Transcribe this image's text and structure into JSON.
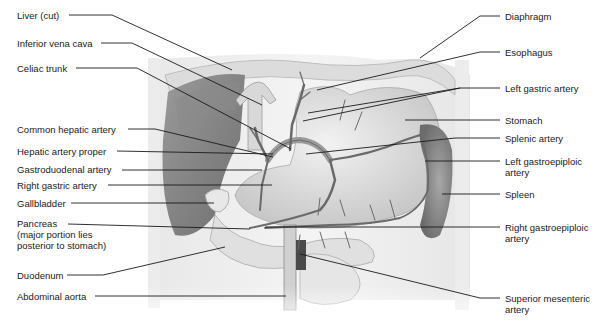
{
  "figure": {
    "type": "anatomical-illustration",
    "left_labels": [
      {
        "id": "liver",
        "text": "Liver (cut)",
        "x": 17,
        "y": 10,
        "line": [
          [
            69,
            15
          ],
          [
            112,
            15
          ],
          [
            232,
            70
          ]
        ]
      },
      {
        "id": "ivc",
        "text": "Inferior vena cava",
        "x": 17,
        "y": 38,
        "line": [
          [
            101,
            43
          ],
          [
            132,
            43
          ],
          [
            262,
            105
          ]
        ]
      },
      {
        "id": "celiac",
        "text": "Celiac trunk",
        "x": 17,
        "y": 63,
        "line": [
          [
            76,
            68
          ],
          [
            137,
            68
          ],
          [
            291,
            149
          ]
        ]
      },
      {
        "id": "common-hepatic",
        "text": "Common hepatic artery",
        "x": 17,
        "y": 124,
        "line": [
          [
            128,
            129
          ],
          [
            155,
            129
          ],
          [
            273,
            157
          ]
        ]
      },
      {
        "id": "hepatic-proper",
        "text": "Hepatic artery proper",
        "x": 17,
        "y": 147,
        "line": [
          [
            117,
            151
          ],
          [
            273,
            154
          ]
        ]
      },
      {
        "id": "gastroduodenal",
        "text": "Gastroduodenal artery",
        "x": 17,
        "y": 165,
        "line": [
          [
            122,
            170
          ],
          [
            262,
            170
          ]
        ]
      },
      {
        "id": "right-gastric",
        "text": "Right gastric artery",
        "x": 17,
        "y": 180,
        "line": [
          [
            108,
            185
          ],
          [
            272,
            185
          ]
        ]
      },
      {
        "id": "gallbladder",
        "text": "Gallbladder",
        "x": 17,
        "y": 199,
        "line": [
          [
            71,
            203
          ],
          [
            214,
            203
          ]
        ]
      },
      {
        "id": "pancreas",
        "text": "Pancreas\n(major portion lies\nposterior to stomach)",
        "x": 17,
        "y": 218,
        "line": [
          [
            68,
            224
          ],
          [
            250,
            229
          ]
        ]
      },
      {
        "id": "duodenum",
        "text": "Duodenum",
        "x": 17,
        "y": 270,
        "line": [
          [
            67,
            275
          ],
          [
            103,
            275
          ],
          [
            225,
            247
          ]
        ]
      },
      {
        "id": "abdominal-aorta",
        "text": "Abdominal aorta",
        "x": 17,
        "y": 291,
        "line": [
          [
            95,
            296
          ],
          [
            286,
            296
          ]
        ]
      }
    ],
    "right_labels": [
      {
        "id": "diaphragm",
        "text": "Diaphragm",
        "x": 505,
        "y": 12,
        "line": [
          [
            500,
            16
          ],
          [
            480,
            16
          ],
          [
            420,
            58
          ]
        ]
      },
      {
        "id": "esophagus",
        "text": "Esophagus",
        "x": 505,
        "y": 47,
        "line": [
          [
            500,
            52
          ],
          [
            480,
            52
          ],
          [
            317,
            90
          ]
        ]
      },
      {
        "id": "left-gastric",
        "text": "Left gastric artery",
        "x": 505,
        "y": 83,
        "line": [
          [
            500,
            88
          ],
          [
            460,
            88
          ],
          [
            308,
            113
          ]
        ],
        "line2": [
          [
            460,
            88
          ],
          [
            303,
            121
          ]
        ]
      },
      {
        "id": "stomach",
        "text": "Stomach",
        "x": 505,
        "y": 115,
        "line": [
          [
            500,
            120
          ],
          [
            405,
            120
          ]
        ]
      },
      {
        "id": "splenic",
        "text": "Splenic artery",
        "x": 505,
        "y": 134,
        "line": [
          [
            500,
            138
          ],
          [
            455,
            138
          ],
          [
            306,
            154
          ]
        ]
      },
      {
        "id": "left-gastroepiploic",
        "text": "Left gastroepiploic\nartery",
        "x": 505,
        "y": 155,
        "line": [
          [
            500,
            161
          ],
          [
            425,
            161
          ]
        ]
      },
      {
        "id": "spleen",
        "text": "Spleen",
        "x": 505,
        "y": 190,
        "line": [
          [
            500,
            194
          ],
          [
            442,
            194
          ]
        ]
      },
      {
        "id": "right-gastroepiploic",
        "text": "Right gastroepiploic\nartery",
        "x": 505,
        "y": 219,
        "line": [
          [
            500,
            227
          ],
          [
            265,
            227
          ]
        ]
      },
      {
        "id": "superior-mesenteric",
        "text": "Superior mesenteric\nartery",
        "x": 505,
        "y": 289,
        "line": [
          [
            500,
            298
          ],
          [
            480,
            298
          ],
          [
            300,
            254
          ]
        ]
      }
    ]
  },
  "colors": {
    "text": "#1a1a1a",
    "leader_line": "#1a1a1a",
    "background": "#ffffff"
  }
}
